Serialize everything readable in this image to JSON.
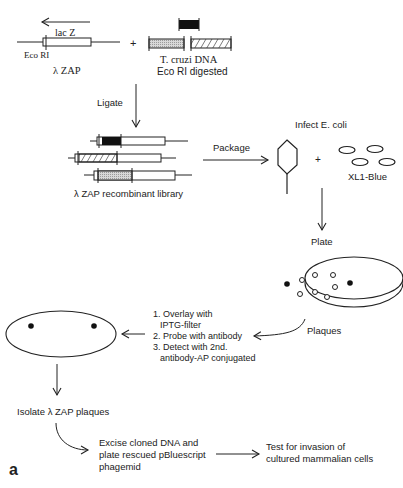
{
  "figure": {
    "panel_label": "a",
    "vector": {
      "gene_label": "lac Z",
      "site_label": "Eco RI",
      "name": "λ ZAP"
    },
    "plus_1": "+",
    "insert": {
      "line1": "T. cruzi DNA",
      "line2": "Eco RI digested"
    },
    "steps": {
      "ligate": "Ligate",
      "library": "λ  ZAP recombinant library",
      "package": "Package",
      "infect": "Infect E. coli",
      "plus_2": "+",
      "host": "XL1-Blue",
      "plate": "Plate",
      "plaques": "Plaques",
      "screen": [
        "1. Overlay with",
        "IPTG-filter",
        "2. Probe with antibody",
        "3. Detect with 2nd.",
        "antibody-AP conjugated"
      ],
      "isolate": "Isolate  λ ZAP plaques",
      "excise": [
        "Excise cloned DNA and",
        "plate rescued pBluescript",
        "phagemid"
      ],
      "test": [
        "Test for invasion of",
        "cultured mammalian cells"
      ]
    },
    "colors": {
      "line": "#222222",
      "stipple": "#bdbdbd",
      "solid": "#111111"
    }
  }
}
